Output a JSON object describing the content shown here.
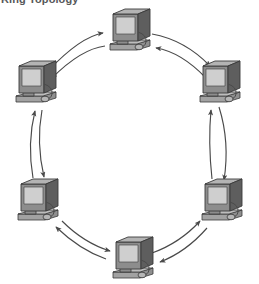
{
  "caption": {
    "text": "Ring Topology",
    "clipped": true
  },
  "diagram": {
    "title": "Ring Topology",
    "type": "network-topology",
    "topology": "ring",
    "node_count": 6,
    "link_style": "bidirectional-curved-arrows",
    "node_icon": "computer-crt-monitor-with-mouse",
    "colors": {
      "background": "#ffffff",
      "monitor_front": "#8d8d8d",
      "monitor_top": "#aeaeae",
      "monitor_side": "#5e5e5e",
      "screen": "#cfcfcf",
      "base": "#9a9a9a",
      "outline": "#3a3a3a",
      "arrow": "#4a4a4a",
      "caption": "#57585a"
    },
    "nodes": [
      {
        "id": "n1",
        "label": "Computer 1",
        "position": "top-center",
        "x": 104,
        "y": 8
      },
      {
        "id": "n2",
        "label": "Computer 2",
        "position": "upper-right",
        "x": 194,
        "y": 60
      },
      {
        "id": "n3",
        "label": "Computer 3",
        "position": "lower-right",
        "x": 196,
        "y": 178
      },
      {
        "id": "n4",
        "label": "Computer 4",
        "position": "bottom-center",
        "x": 107,
        "y": 236
      },
      {
        "id": "n5",
        "label": "Computer 5",
        "position": "lower-left",
        "x": 12,
        "y": 178
      },
      {
        "id": "n6",
        "label": "Computer 6",
        "position": "upper-left",
        "x": 10,
        "y": 60
      }
    ],
    "links": [
      {
        "from": "n6",
        "to": "n1",
        "direction": "bidirectional"
      },
      {
        "from": "n1",
        "to": "n2",
        "direction": "bidirectional"
      },
      {
        "from": "n2",
        "to": "n3",
        "direction": "bidirectional"
      },
      {
        "from": "n3",
        "to": "n4",
        "direction": "bidirectional"
      },
      {
        "from": "n4",
        "to": "n5",
        "direction": "bidirectional"
      },
      {
        "from": "n5",
        "to": "n6",
        "direction": "bidirectional"
      }
    ]
  }
}
